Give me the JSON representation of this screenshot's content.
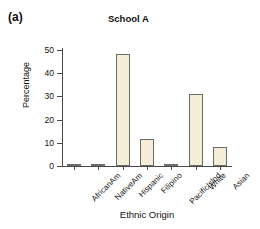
{
  "panel": {
    "label": "(a)"
  },
  "chart_data": {
    "type": "bar",
    "title": "School A",
    "xlabel": "Ethnic Origin",
    "ylabel": "Percentage",
    "categories": [
      "AfricanAm",
      "NativeAm",
      "Hispanic",
      "Filipino",
      "PacificIslnd",
      "White",
      "Asian"
    ],
    "values": [
      1.0,
      0.6,
      48.2,
      11.7,
      0.4,
      31.0,
      8.0
    ],
    "ylim": [
      0,
      52
    ],
    "yticks": [
      0,
      10,
      20,
      30,
      40,
      50
    ],
    "ytick_labels": [
      "0",
      "10",
      "20",
      "30",
      "40",
      "50"
    ],
    "grid": false,
    "legend": null,
    "bar_color": "#f6edd7",
    "bar_edge_color": "#6b6b6b",
    "axis_color": "#4a4a4a",
    "text_color": "#111111"
  }
}
